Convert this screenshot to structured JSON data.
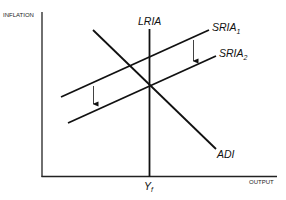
{
  "diagram": {
    "type": "economics-AD-AS-shift",
    "axes": {
      "y_label": "INFLATION",
      "x_label": "OUTPUT",
      "x_tick_label": "Y",
      "x_tick_sub": "f"
    },
    "curves": {
      "lria": {
        "label": "LRIA"
      },
      "sria1": {
        "label": "SRIA",
        "sub": "1"
      },
      "sria2": {
        "label": "SRIA",
        "sub": "2"
      },
      "adi": {
        "label": "ADI"
      }
    },
    "annotations": [
      {
        "type": "arrow",
        "direction": "down",
        "meaning": "SRIA shifts from SRIA1 to SRIA2"
      },
      {
        "type": "arrow",
        "direction": "down",
        "meaning": "SRIA shifts from SRIA1 to SRIA2"
      }
    ],
    "colors": {
      "line": "#111111",
      "background": "#ffffff"
    }
  }
}
